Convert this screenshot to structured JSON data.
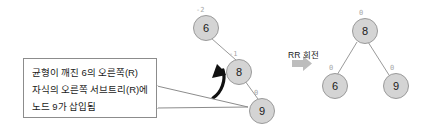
{
  "diagram": {
    "transform_label": "RR 회전",
    "callout": {
      "line1": "균형이 깨진 6의 오른쪽(R)",
      "line2": "자식의 오른쪽 서브트리(R)에",
      "line3": "노드 9가 삽입됨"
    },
    "before_tree": {
      "name": "unbalanced-tree",
      "nodes": [
        {
          "id": "before-6",
          "value": "6",
          "balance_factor": "-2",
          "x": 193,
          "y": 15
        },
        {
          "id": "before-8",
          "value": "8",
          "balance_factor": "-1",
          "x": 226,
          "y": 59
        },
        {
          "id": "before-9",
          "value": "9",
          "balance_factor": "0",
          "x": 249,
          "y": 98
        }
      ],
      "edges": [
        {
          "from": "before-6",
          "to": "before-8"
        },
        {
          "from": "before-8",
          "to": "before-9"
        }
      ]
    },
    "after_tree": {
      "name": "balanced-tree",
      "nodes": [
        {
          "id": "after-8",
          "value": "8",
          "balance_factor": "0",
          "x": 352,
          "y": 18
        },
        {
          "id": "after-6",
          "value": "6",
          "balance_factor": "0",
          "x": 322,
          "y": 73
        },
        {
          "id": "after-9",
          "value": "9",
          "balance_factor": "0",
          "x": 383,
          "y": 73
        }
      ],
      "edges": [
        {
          "from": "after-8",
          "to": "after-6"
        },
        {
          "from": "after-8",
          "to": "after-9"
        }
      ]
    },
    "icons": {
      "rotation_arrow": "curved-counterclockwise-arrow-icon",
      "transform_arrow": "right-block-arrow-icon",
      "callout_tail": "callout-pointer-icon"
    },
    "colors": {
      "node_fill": "#d4d4d4",
      "node_stroke": "#9a9a9a",
      "balance_factor_text": "#a8a8a8",
      "edge": "#9a9a9a",
      "rotation_arrow": "#111111",
      "transform_arrow": "#bdbdbd",
      "callout_border": "#8c8c8c",
      "text": "#1a1a1a",
      "background": "#ffffff"
    }
  }
}
